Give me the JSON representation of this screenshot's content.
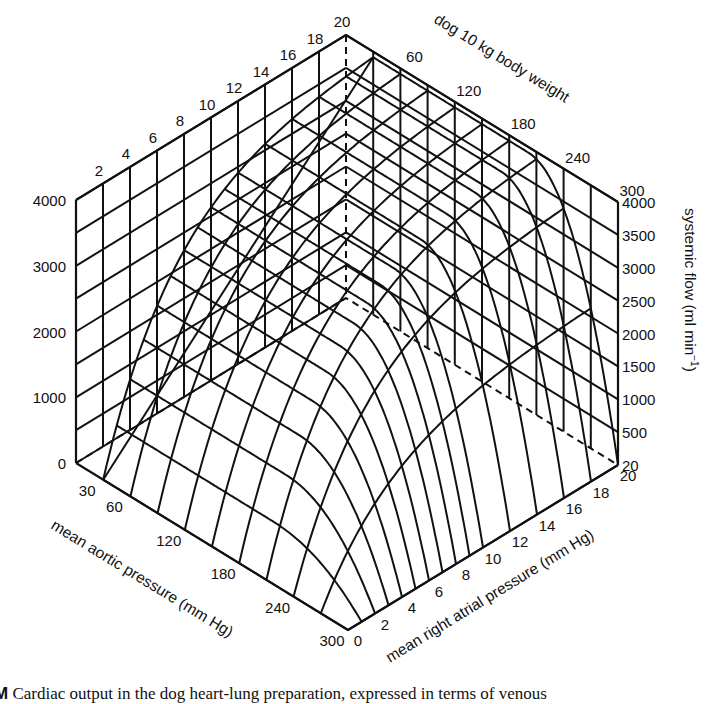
{
  "chart_data": {
    "type": "surface3d",
    "title": "",
    "subtitle": "dog 10 kg body weight",
    "axes": {
      "x": {
        "label": "mean aortic pressure (mm Hg)",
        "ticks": [
          30,
          60,
          120,
          180,
          240,
          300
        ],
        "range": [
          0,
          300
        ]
      },
      "y": {
        "label": "mean right atrial pressure (mm Hg)",
        "ticks": [
          0,
          2,
          4,
          6,
          8,
          10,
          12,
          14,
          16,
          18,
          20
        ],
        "range": [
          0,
          20
        ]
      },
      "z": {
        "label": "systemic flow (ml min⁻¹)",
        "range": [
          0,
          4000
        ],
        "ticks_left": [
          0,
          1000,
          2000,
          3000,
          4000
        ],
        "ticks_right": [
          20,
          500,
          1000,
          1500,
          2000,
          2500,
          3000,
          3500,
          4000
        ]
      },
      "back_wall_top_ticks_rap": [
        2,
        4,
        6,
        8,
        10,
        12,
        14,
        16,
        18,
        20
      ],
      "back_wall_top_ticks_aortic": [
        60,
        120,
        180,
        240,
        300
      ]
    },
    "surface_samples": {
      "aortic": [
        30,
        60,
        90,
        120,
        150,
        180,
        210,
        240,
        270,
        300
      ],
      "rap": [
        0,
        2,
        4,
        6,
        8,
        10,
        12,
        14,
        16,
        18,
        20
      ],
      "note": "flow (ml/min) ≈ plateau-limited function; see grid rendering"
    },
    "grid": true,
    "legend": null
  },
  "labels": {
    "subtitle": "dog 10 kg body weight",
    "x_axis": "mean aortic pressure (mm Hg)",
    "y_axis": "mean right atrial pressure (mm Hg)",
    "z_axis": "systemic flow (ml min",
    "z_axis_sup": "−1",
    "z_axis_close": ")"
  },
  "caption": {
    "lead": "M",
    "text": " Cardiac output in the dog heart-lung preparation, expressed in terms of venous"
  }
}
